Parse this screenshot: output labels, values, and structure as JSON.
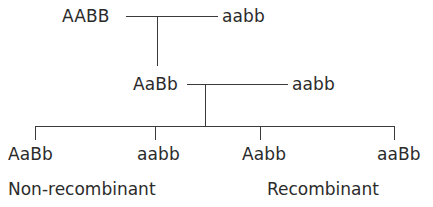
{
  "diagram": {
    "line_color": "#3a3a3a",
    "text_color": "#2b2b2b",
    "background_color": "#ffffff"
  },
  "parental_generation": {
    "parent_1": "AABB",
    "parent_2": "aabb"
  },
  "f1_generation": {
    "f1_individual": "AaBb",
    "testcross_partner": "aabb"
  },
  "offspring": [
    {
      "genotype": "AaBb",
      "class": "non-recombinant"
    },
    {
      "genotype": "aabb",
      "class": "non-recombinant"
    },
    {
      "genotype": "Aabb",
      "class": "recombinant"
    },
    {
      "genotype": "aaBb",
      "class": "recombinant"
    }
  ],
  "captions": {
    "left": "Non-recombinant",
    "right": "Recombinant"
  }
}
